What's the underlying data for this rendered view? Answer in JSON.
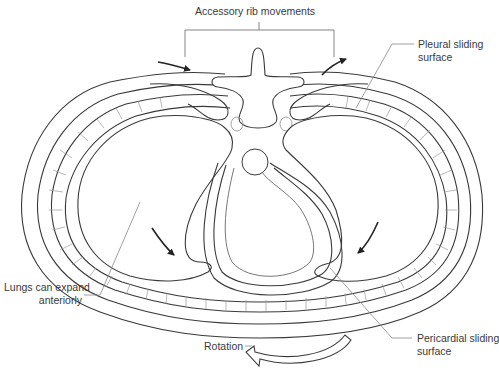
{
  "diagram": {
    "labels": {
      "accessory_rib": "Accessory rib movements",
      "pleural_line1": "Pleural sliding",
      "pleural_line2": "surface",
      "lungs_line1": "Lungs can expand",
      "lungs_line2": "anteriorly",
      "pericardial_line1": "Pericardial sliding",
      "pericardial_line2": "surface",
      "rotation": "Rotation"
    },
    "colors": {
      "line": "#3a3a3a",
      "leader": "#777777",
      "hatch": "#9a9a9a",
      "background": "#ffffff"
    },
    "structures": [
      "vertebra",
      "rib-heads",
      "aorta",
      "left-lung",
      "right-lung",
      "heart",
      "pericardium",
      "chest-wall",
      "rib-layer"
    ]
  }
}
